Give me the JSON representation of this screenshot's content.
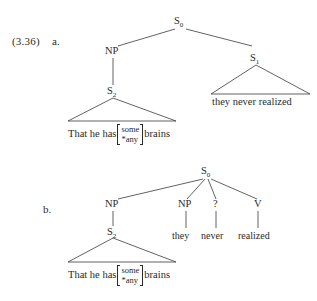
{
  "page": {
    "example_number": "(3.36)",
    "background_color": "#ffffff",
    "ink_color": "#2b2b2b"
  },
  "items": [
    {
      "letter": "a.",
      "tree": {
        "root": {
          "label": "S",
          "subscript": "0"
        },
        "nodes": [
          {
            "id": "s0",
            "label": "S",
            "subscript": "0"
          },
          {
            "id": "np",
            "label": "NP",
            "subscript": ""
          },
          {
            "id": "s2",
            "label": "S",
            "subscript": "2"
          },
          {
            "id": "s1",
            "label": "S",
            "subscript": "1"
          }
        ],
        "triangles": [
          {
            "id": "s2-triangle",
            "apex": "S2",
            "leaf_pre": "That he has",
            "leaf_alt_top": "some",
            "leaf_alt_bottom": "*any",
            "leaf_post": "brains"
          },
          {
            "id": "s1-triangle",
            "apex": "S1",
            "leaf_text": "they never realized"
          }
        ]
      }
    },
    {
      "letter": "b.",
      "tree": {
        "root": {
          "label": "S",
          "subscript": "0"
        },
        "nodes": [
          {
            "id": "s0",
            "label": "S",
            "subscript": "0"
          },
          {
            "id": "np1",
            "label": "NP",
            "subscript": ""
          },
          {
            "id": "s2",
            "label": "S",
            "subscript": "2"
          },
          {
            "id": "np2",
            "label": "NP",
            "subscript": ""
          },
          {
            "id": "q",
            "label": "?",
            "subscript": ""
          },
          {
            "id": "v",
            "label": "V",
            "subscript": ""
          }
        ],
        "terminals": [
          {
            "id": "terminal-they",
            "text": "they"
          },
          {
            "id": "terminal-never",
            "text": "never"
          },
          {
            "id": "terminal-realized",
            "text": "realized"
          }
        ],
        "triangles": [
          {
            "id": "s2-triangle",
            "apex": "S2",
            "leaf_pre": "That he has",
            "leaf_alt_top": "some",
            "leaf_alt_bottom": "*any",
            "leaf_post": "brains"
          }
        ]
      }
    }
  ]
}
